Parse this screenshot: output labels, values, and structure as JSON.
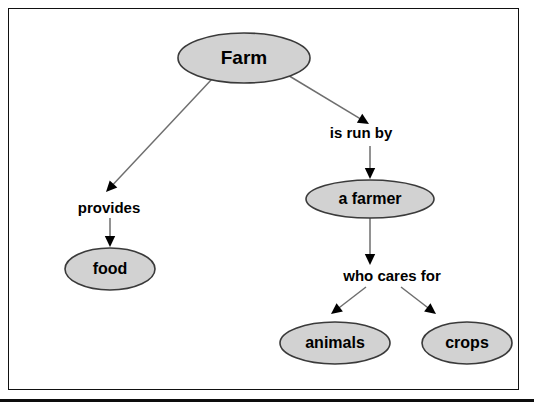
{
  "diagram": {
    "canvas": {
      "width": 534,
      "height": 409,
      "background": "#ffffff"
    },
    "frame": {
      "border_color": "#111111",
      "rule_color": "#0d0d0d"
    },
    "style": {
      "node_fill": "#d2d2d2",
      "node_stroke": "#3a3a3a",
      "edge_color": "#6e6e6e",
      "arrowhead_color": "#000000",
      "text_color": "#000000"
    },
    "nodes": [
      {
        "id": "farm",
        "label": "Farm",
        "cx": 244,
        "cy": 58,
        "rx": 66,
        "ry": 25,
        "font_size": 19
      },
      {
        "id": "food",
        "label": "food",
        "cx": 110,
        "cy": 269,
        "rx": 45,
        "ry": 21,
        "font_size": 16
      },
      {
        "id": "farmer",
        "label": "a farmer",
        "cx": 370,
        "cy": 199,
        "rx": 64,
        "ry": 19,
        "font_size": 16
      },
      {
        "id": "animals",
        "label": "animals",
        "cx": 335,
        "cy": 343,
        "rx": 55,
        "ry": 21,
        "font_size": 16
      },
      {
        "id": "crops",
        "label": "crops",
        "cx": 467,
        "cy": 343,
        "rx": 45,
        "ry": 21,
        "font_size": 16
      }
    ],
    "edge_labels": [
      {
        "id": "provides",
        "text": "provides",
        "cx": 109,
        "cy": 209,
        "font_size": 15
      },
      {
        "id": "is-run-by",
        "text": "is run by",
        "cx": 361,
        "cy": 134,
        "font_size": 15
      },
      {
        "id": "who-cares-for",
        "text": "who cares for",
        "cx": 392,
        "cy": 277,
        "font_size": 15
      }
    ],
    "edges": [
      {
        "id": "farm-to-provides",
        "from": "farm",
        "to": "provides",
        "x1": 212,
        "y1": 79,
        "x2": 106,
        "y2": 192
      },
      {
        "id": "provides-to-food",
        "from": "provides",
        "to": "food",
        "x1": 110,
        "y1": 218,
        "x2": 110,
        "y2": 247
      },
      {
        "id": "farm-to-is-run-by",
        "from": "farm",
        "to": "is-run-by",
        "x1": 286,
        "y1": 74,
        "x2": 369,
        "y2": 124
      },
      {
        "id": "is-run-by-to-farmer",
        "from": "is-run-by",
        "to": "farmer",
        "x1": 370,
        "y1": 146,
        "x2": 370,
        "y2": 179
      },
      {
        "id": "farmer-to-who-cares-for",
        "from": "farmer",
        "to": "who-cares-for",
        "x1": 370,
        "y1": 217,
        "x2": 370,
        "y2": 265
      },
      {
        "id": "who-cares-for-to-animals",
        "from": "who-cares-for",
        "to": "animals",
        "x1": 366,
        "y1": 287,
        "x2": 331,
        "y2": 314
      },
      {
        "id": "who-cares-for-to-crops",
        "from": "who-cares-for",
        "to": "crops",
        "x1": 401,
        "y1": 287,
        "x2": 436,
        "y2": 314
      }
    ]
  }
}
